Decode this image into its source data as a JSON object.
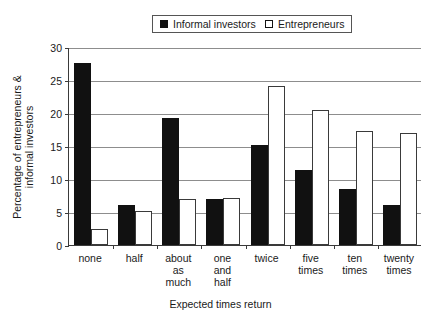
{
  "chart_data": {
    "type": "bar",
    "title": "",
    "xlabel": "Expected times return",
    "ylabel": "Percentage of entrepreneurs &\ninformal investors",
    "ylabel_line1": "Percentage of entrepreneurs &",
    "ylabel_line2": "informal investors",
    "categories": [
      "none",
      "half",
      "about\nas\nmuch",
      "one\nand\nhalf",
      "twice",
      "five\ntimes",
      "ten\ntimes",
      "twenty\ntimes"
    ],
    "ylim": [
      0,
      30
    ],
    "yticks": [
      0,
      5,
      10,
      15,
      20,
      25,
      30
    ],
    "ytick_labels": [
      "0",
      "5",
      "10",
      "15",
      "20",
      "25",
      "30"
    ],
    "grid": true,
    "legend_position": "top-center",
    "series": [
      {
        "name": "Informal investors",
        "color": "#111111",
        "style": "filled",
        "values": [
          27.6,
          6.0,
          19.3,
          7.0,
          15.1,
          11.4,
          8.5,
          6.0
        ]
      },
      {
        "name": "Entrepreneurs",
        "color": "#ffffff",
        "style": "hollow",
        "values": [
          2.4,
          5.2,
          7.0,
          7.1,
          24.1,
          20.4,
          17.3,
          17.0
        ]
      }
    ]
  }
}
